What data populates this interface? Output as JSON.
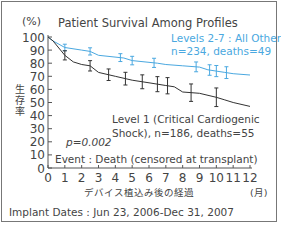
{
  "chart_data": {
    "type": "line",
    "title": "Patient Survival Among Profiles",
    "xlabel": "デバイス植込み後の経過",
    "x_unit": "(月)",
    "ylabel": "生存率",
    "y_unit": "(%)",
    "xlim": [
      0,
      12
    ],
    "ylim": [
      0,
      100
    ],
    "x_ticks": [
      0,
      1,
      2,
      3,
      4,
      5,
      6,
      7,
      8,
      9,
      10,
      11,
      12
    ],
    "y_ticks": [
      0,
      10,
      20,
      30,
      40,
      50,
      60,
      70,
      80,
      90,
      100
    ],
    "grid": false,
    "series": [
      {
        "name": "Levels 2-7 : All Others, n=234, deaths=49",
        "color": "#4aa8e0",
        "x": [
          0,
          0.3,
          1,
          2,
          2.5,
          3,
          4.5,
          5,
          6.5,
          7,
          8,
          9,
          9.5,
          10,
          10.5,
          11,
          12
        ],
        "y": [
          100,
          97,
          92,
          90,
          89,
          86,
          84,
          82,
          80,
          79,
          78,
          77,
          75,
          74,
          73,
          72,
          71
        ],
        "error_bars_at": [
          1,
          2.5,
          4.3,
          5,
          6.3,
          8.8,
          9.6,
          10,
          10.6
        ]
      },
      {
        "name": "Level 1 (Critical Cardiogenic Shock), n=186, deaths=55",
        "color": "#333333",
        "x": [
          0,
          0.3,
          1,
          1.5,
          2,
          2.5,
          3,
          4,
          5,
          6,
          7,
          7.5,
          8,
          9,
          10,
          10.5,
          11,
          12
        ],
        "y": [
          100,
          97,
          86,
          81,
          79,
          78,
          73,
          70,
          67,
          65,
          63,
          62,
          58,
          57,
          54,
          52,
          50,
          47
        ],
        "error_bars_at": [
          1,
          2.5,
          3.6,
          4.6,
          5.6,
          6.5,
          7.1,
          8.5,
          10
        ]
      }
    ],
    "annotations": [
      "Levels 2-7 : All Others,",
      "n=234, deaths=49",
      "Level 1 (Critical Cardiogenic",
      "Shock), n=186, deaths=55",
      "p=0.002",
      "Event : Death (censored at transplant)"
    ],
    "footer": "Implant Dates : Jun 23, 2006-Dec 31, 2007"
  },
  "labels": {
    "title": "Patient Survival Among Profiles",
    "y_unit": "(%)",
    "y_label_chars": [
      "生",
      "存",
      "率"
    ],
    "x_label": "デバイス植込み後の経過",
    "x_unit": "(月)",
    "blue_line1": "Levels 2-7 : All Others,",
    "blue_line2": "n=234, deaths=49",
    "black_line1": "Level 1 (Critical Cardiogenic",
    "black_line2": "Shock), n=186, deaths=55",
    "p_value": "p=0.002",
    "event": "Event : Death (censored at transplant)",
    "footer": "Implant Dates : Jun 23, 2006-Dec 31, 2007"
  }
}
